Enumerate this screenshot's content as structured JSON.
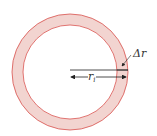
{
  "diagram": {
    "ring": {
      "fill": "#f2d4d0",
      "stroke": "#d9534f",
      "outer_radius": 58,
      "inner_radius": 47,
      "center": [
        70,
        72
      ]
    },
    "labels": {
      "delta_r": "Δr",
      "r_i": "r",
      "r_i_sub": "i"
    }
  }
}
